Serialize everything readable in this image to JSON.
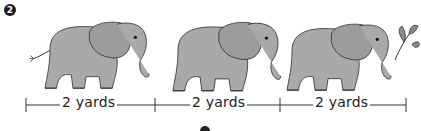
{
  "problem": {
    "number": "2"
  },
  "elephants": [
    {
      "name": "elephant-1",
      "holds": "tail"
    },
    {
      "name": "elephant-2",
      "holds": "tail of elephant 1"
    },
    {
      "name": "elephant-3",
      "holds": "leafy branch"
    }
  ],
  "measurements": [
    {
      "label": "2 yards"
    },
    {
      "label": "2 yards"
    },
    {
      "label": "2 yards"
    }
  ],
  "colors": {
    "elephant_fill": "#a9a9a9",
    "elephant_shade": "#8e8e8e",
    "outline": "#333333",
    "leaf": "#7f7f7f"
  }
}
